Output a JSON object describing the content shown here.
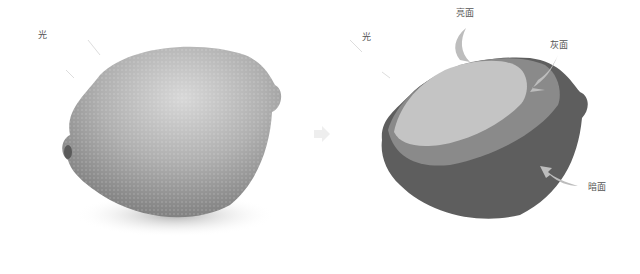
{
  "left_panel": {
    "light_label": "光",
    "subject": "lemon-photo"
  },
  "center": {
    "icon": "arrow-right-icon"
  },
  "right_panel": {
    "light_label": "光",
    "highlight_label": "亮面",
    "midtone_label": "灰面",
    "shadow_label": "暗面"
  },
  "colors": {
    "background": "#ffffff",
    "highlight": "#c4c4c4",
    "midtone": "#8a8a8a",
    "shadow": "#5e5e5e",
    "arrow": "#bdbdbd",
    "photo_mid": "#a8a8a8"
  }
}
